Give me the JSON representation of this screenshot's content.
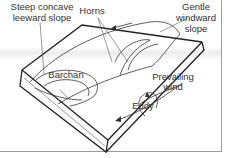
{
  "diagram": {
    "labels": {
      "leeward": [
        "Steep concave",
        "leeward slope"
      ],
      "horns": "Horns",
      "windward": [
        "Gentle",
        "windward",
        "slope"
      ],
      "barchan": "Barchan",
      "wind": [
        "Prevailing",
        "wind"
      ],
      "eddy": "Eddy"
    },
    "colors": {
      "line": "#333333",
      "frame": "#9a9a9a",
      "background": "#ffffff"
    },
    "icons": [
      "wind-arrow-icon",
      "eddy-arrow-icon",
      "flow-arrow-icon"
    ]
  }
}
